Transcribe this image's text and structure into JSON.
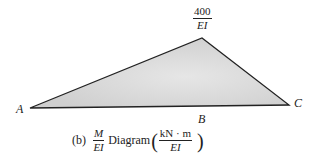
{
  "diagram": {
    "type": "bending-moment-over-EI",
    "fill_color": "#d9d9d9",
    "stroke_color": "#222222",
    "points": {
      "A": {
        "label": "A",
        "x": 30,
        "y": 108
      },
      "peak": {
        "x": 202,
        "y": 38
      },
      "C": {
        "label": "C",
        "x": 289,
        "y": 105
      }
    },
    "peak_value": {
      "numerator": "400",
      "denominator": "EI"
    },
    "labels": {
      "A": "A",
      "B": "B",
      "C": "C"
    }
  },
  "caption": {
    "tag": "(b)",
    "fraction": {
      "numerator": "M",
      "denominator": "EI"
    },
    "title": "Diagram",
    "units": {
      "numerator": "kN · m",
      "denominator": "EI"
    }
  }
}
